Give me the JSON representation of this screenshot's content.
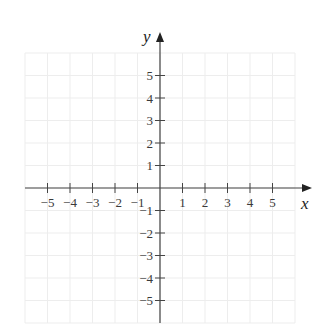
{
  "figure": {
    "x_axis": {
      "label": "x",
      "min": -6,
      "max": 6,
      "tick_values": [
        -5,
        -4,
        -3,
        -2,
        -1,
        1,
        2,
        3,
        4,
        5
      ],
      "tick_labels": [
        "−5",
        "−4",
        "−3",
        "−2",
        "−1",
        "1",
        "2",
        "3",
        "4",
        "5"
      ]
    },
    "y_axis": {
      "label": "y",
      "min": -6,
      "max": 6,
      "tick_values": [
        5,
        4,
        3,
        2,
        1,
        -1,
        -2,
        -3,
        -4,
        -5
      ],
      "tick_labels": [
        "5",
        "4",
        "3",
        "2",
        "1",
        "−1",
        "−2",
        "−3",
        "−4",
        "−5"
      ]
    },
    "grid": true,
    "colors": {
      "axis": "#444444",
      "grid": "#ededed",
      "text": "#3a3a3a"
    }
  },
  "layout": {
    "origin_px": [
      160,
      188
    ],
    "unit_px": 22.5
  }
}
